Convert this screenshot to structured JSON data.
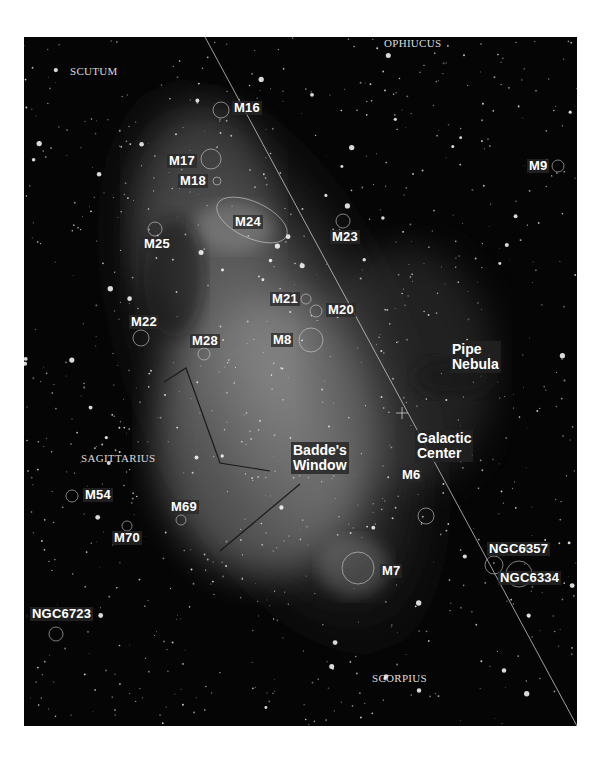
{
  "map": {
    "type": "star-chart",
    "region": "Milky Way toward Sagittarius",
    "constellations": [
      {
        "id": "scutum",
        "label": "SCUTUM",
        "x": 46,
        "y": 28
      },
      {
        "id": "ophiucus",
        "label": "OPHIUCUS",
        "x": 360,
        "y": 0
      },
      {
        "id": "sagittarius",
        "label": "SAGITTARIUS",
        "x": 57,
        "y": 415
      },
      {
        "id": "scorpius",
        "label": "SCORPIUS",
        "x": 348,
        "y": 635
      }
    ],
    "objects": [
      {
        "id": "m16",
        "label": "M16",
        "lx": 208,
        "ly": 64,
        "cx": 197,
        "cy": 73,
        "r": 8
      },
      {
        "id": "m17",
        "label": "M17",
        "lx": 143,
        "ly": 117,
        "cx": 187,
        "cy": 122,
        "r": 10
      },
      {
        "id": "m18",
        "label": "M18",
        "lx": 154,
        "ly": 137,
        "cx": 193,
        "cy": 144,
        "r": 4
      },
      {
        "id": "m24",
        "label": "M24",
        "lx": 209,
        "ly": 178,
        "cx": 228,
        "cy": 184,
        "r": 0
      },
      {
        "id": "m23",
        "label": "M23",
        "lx": 306,
        "ly": 193,
        "cx": 319,
        "cy": 184,
        "r": 7
      },
      {
        "id": "m25",
        "label": "M25",
        "lx": 118,
        "ly": 200,
        "cx": 131,
        "cy": 192,
        "r": 7
      },
      {
        "id": "m9",
        "label": "M9",
        "lx": 503,
        "ly": 122,
        "cx": 534,
        "cy": 129,
        "r": 6
      },
      {
        "id": "m21",
        "label": "M21",
        "lx": 246,
        "ly": 255,
        "cx": 282,
        "cy": 262,
        "r": 5
      },
      {
        "id": "m20",
        "label": "M20",
        "lx": 302,
        "ly": 266,
        "cx": 292,
        "cy": 274,
        "r": 6
      },
      {
        "id": "m8",
        "label": "M8",
        "lx": 247,
        "ly": 296,
        "cx": 287,
        "cy": 303,
        "r": 12
      },
      {
        "id": "m22",
        "label": "M22",
        "lx": 105,
        "ly": 278,
        "cx": 117,
        "cy": 301,
        "r": 8
      },
      {
        "id": "m28",
        "label": "M28",
        "lx": 166,
        "ly": 297,
        "cx": 180,
        "cy": 317,
        "r": 6
      },
      {
        "id": "m54",
        "label": "M54",
        "lx": 59,
        "ly": 451,
        "cx": 48,
        "cy": 459,
        "r": 6
      },
      {
        "id": "m69",
        "label": "M69",
        "lx": 145,
        "ly": 463,
        "cx": 157,
        "cy": 483,
        "r": 5
      },
      {
        "id": "m70",
        "label": "M70",
        "lx": 88,
        "ly": 494,
        "cx": 103,
        "cy": 489,
        "r": 5
      },
      {
        "id": "m6",
        "label": "M6",
        "lx": 376,
        "ly": 431,
        "cx": 402,
        "cy": 479,
        "r": 8
      },
      {
        "id": "m7",
        "label": "M7",
        "lx": 356,
        "ly": 527,
        "cx": 334,
        "cy": 531,
        "r": 16
      },
      {
        "id": "ngc6357",
        "label": "NGC6357",
        "lx": 463,
        "ly": 505,
        "cx": 470,
        "cy": 528,
        "r": 9
      },
      {
        "id": "ngc6334",
        "label": "NGC6334",
        "lx": 474,
        "ly": 534,
        "cx": 495,
        "cy": 537,
        "r": 13
      },
      {
        "id": "ngc6723",
        "label": "NGC6723",
        "lx": 6,
        "ly": 570,
        "cx": 32,
        "cy": 597,
        "r": 7
      }
    ],
    "regions": [
      {
        "id": "pipe-nebula",
        "label": "Pipe\nNebula",
        "x": 426,
        "y": 304
      },
      {
        "id": "galactic-center",
        "label": "Galactic\nCenter",
        "x": 391,
        "y": 393
      },
      {
        "id": "baddes-window",
        "label": "Badde's\nWindow",
        "x": 267,
        "y": 405
      }
    ],
    "galactic_equator": {
      "x1": 181,
      "y1": 0,
      "x2": 553,
      "y2": 689
    },
    "constellation_lines": [
      [
        [
          140,
          345
        ],
        [
          162,
          331
        ],
        [
          196,
          426
        ],
        [
          246,
          434
        ]
      ],
      [
        [
          276,
          447
        ],
        [
          196,
          514
        ]
      ]
    ]
  }
}
